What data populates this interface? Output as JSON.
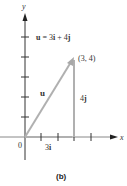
{
  "diagram": {
    "axis_labels": {
      "x": "x",
      "y": "y"
    },
    "origin_label": "0",
    "equation": {
      "u": "u",
      "eq": " = 3",
      "i": "i",
      "plus": " + 4",
      "j": "j"
    },
    "point_label": "(3, 4)",
    "vector_label": "u",
    "horizontal_component": {
      "coef": "3",
      "unit": "i"
    },
    "vertical_component": {
      "coef": "4",
      "unit": "j"
    },
    "caption": "(b)",
    "colors": {
      "axis": "#333333",
      "vector": "#b0b0b0"
    }
  }
}
